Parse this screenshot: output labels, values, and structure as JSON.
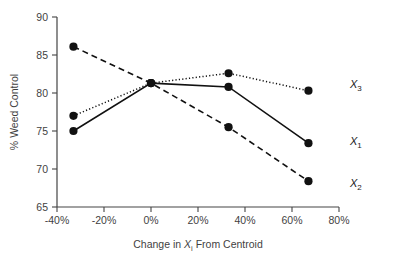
{
  "chart_data": {
    "type": "line",
    "title": "",
    "xlabel": "Change in Xi From Centroid",
    "xlabel_parts": {
      "pre": "Change in ",
      "var": "X",
      "sub": "i",
      "post": " From Centroid"
    },
    "ylabel": "% Weed Control",
    "x": [
      -33,
      0,
      33,
      67
    ],
    "xlim": [
      -40,
      80
    ],
    "ylim": [
      65,
      90
    ],
    "xticks": [
      -40,
      -20,
      0,
      20,
      40,
      60,
      80
    ],
    "xticklabels": [
      "-40%",
      "-20%",
      "0%",
      "20%",
      "40%",
      "60%",
      "80%"
    ],
    "yticks": [
      65,
      70,
      75,
      80,
      85,
      90
    ],
    "yticklabels": [
      "65",
      "70",
      "75",
      "80",
      "85",
      "90"
    ],
    "grid": false,
    "legend_position": "right-inline",
    "series": [
      {
        "name": "X1",
        "label_var": "X",
        "label_sub": "1",
        "linestyle": "solid",
        "color": "#111111",
        "values": [
          75.0,
          81.3,
          80.8,
          73.4
        ]
      },
      {
        "name": "X2",
        "label_var": "X",
        "label_sub": "2",
        "linestyle": "dashed",
        "color": "#111111",
        "values": [
          86.1,
          81.3,
          75.5,
          68.4
        ]
      },
      {
        "name": "X3",
        "label_var": "X",
        "label_sub": "3",
        "linestyle": "dotted",
        "color": "#111111",
        "values": [
          77.0,
          81.3,
          82.6,
          80.3
        ]
      }
    ]
  },
  "axes": {
    "y_axis_title": "% Weed Control",
    "x_axis_title_pre": "Change in ",
    "x_axis_title_var": "X",
    "x_axis_title_sub": "i",
    "x_axis_title_post": " From Centroid"
  },
  "labels": {
    "x1": "X",
    "x1_sub": "1",
    "x2": "X",
    "x2_sub": "2",
    "x3": "X",
    "x3_sub": "3"
  },
  "ticks": {
    "y": [
      "90",
      "85",
      "80",
      "75",
      "70",
      "65"
    ],
    "x": [
      "-40%",
      "-20%",
      "0%",
      "20%",
      "40%",
      "60%",
      "80%"
    ]
  },
  "colors": {
    "series": "#111111",
    "axis": "#444444",
    "text": "#3f3f3f",
    "background": "#ffffff"
  }
}
